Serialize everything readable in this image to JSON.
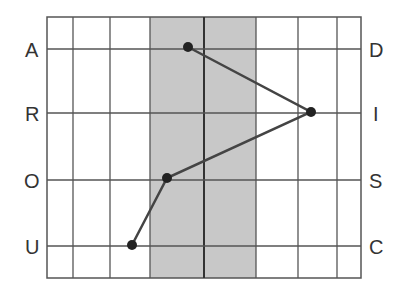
{
  "diagram": {
    "type": "letter-grid-path",
    "left_labels": [
      "A",
      "R",
      "O",
      "U"
    ],
    "right_labels": [
      "D",
      "I",
      "S",
      "C"
    ],
    "grid": {
      "left": 47,
      "top": 17,
      "right": 361,
      "bottom": 278,
      "vertical_lines": [
        73,
        110,
        150,
        204,
        256,
        298,
        337
      ],
      "row_lines": [
        49,
        113,
        180,
        246
      ],
      "center_line_x": 204,
      "shaded_band": {
        "x1": 150,
        "x2": 256,
        "color": "#c8c8c8"
      }
    },
    "points": [
      {
        "label": "A",
        "x": 188,
        "y": 47
      },
      {
        "label": "I",
        "x": 311,
        "y": 112
      },
      {
        "label": "O",
        "x": 167,
        "y": 178
      },
      {
        "label": "U",
        "x": 132,
        "y": 245
      }
    ],
    "colors": {
      "line": "#444444",
      "point": "#222222",
      "grid": "#555555",
      "shade": "#c8c8c8",
      "text": "#333333"
    }
  }
}
